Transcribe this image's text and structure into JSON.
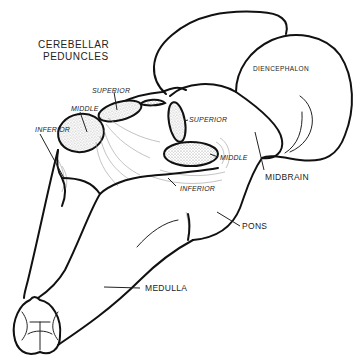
{
  "diagram": {
    "title_line1": "CEREBELLAR",
    "title_line2": "PEDUNCLES",
    "labels": {
      "superior_left": "SUPERIOR",
      "middle_left": "MIDDLE",
      "inferior_left": "INFERIOR",
      "superior_right": "SUPERIOR",
      "middle_right": "MIDDLE",
      "inferior_right": "INFERIOR",
      "diencephalon": "DIENCEPHALON",
      "midbrain": "MIDBRAIN",
      "pons": "PONS",
      "medulla": "MEDULLA"
    },
    "colors": {
      "line": "#111111",
      "background": "#ffffff",
      "stipple": "#8a8a8a"
    }
  }
}
